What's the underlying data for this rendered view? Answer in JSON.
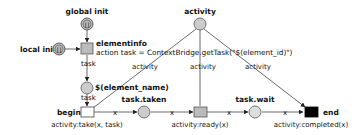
{
  "diagram": {
    "type": "petri-net",
    "colors": {
      "place_fill": "#cccccc",
      "place_stroke": "#555555",
      "transition_grey": "#bbbbbb",
      "transition_white": "#ffffff",
      "transition_black": "#000000",
      "arc": "#444444"
    },
    "nodes": {
      "global_init": {
        "label": "global init",
        "token": "[]"
      },
      "local_init": {
        "label": "local init",
        "token": "[]"
      },
      "elementinfo": {
        "label": "elementinfo",
        "action": "action task = ContextBridge.getTask(\"$(element_id)\")"
      },
      "activity": {
        "label": "activity"
      },
      "element_name": {
        "label": "$(element_name)"
      },
      "begin": {
        "label": "begin",
        "guard": "activity:take(x, task)"
      },
      "task_taken": {
        "label": "task.taken"
      },
      "ready": {
        "guard": "activity:ready(x)"
      },
      "task_wait": {
        "label": "task.wait"
      },
      "end": {
        "label": "end",
        "guard": "activity:completed(x)"
      }
    },
    "arc_labels": {
      "elementinfo_to_element_name": "task",
      "element_name_to_begin": "task",
      "activity_to_begin": "activity",
      "activity_to_ready": "activity",
      "activity_to_end": "activity",
      "begin_to_taken": "x",
      "taken_to_ready": "x",
      "ready_to_wait": "x",
      "wait_to_end": "x"
    }
  }
}
